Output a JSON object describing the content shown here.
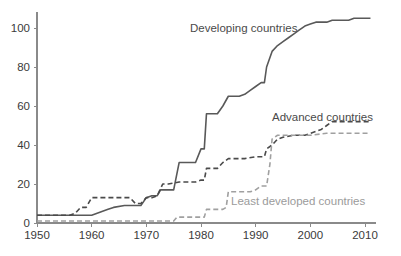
{
  "chart_data": {
    "type": "line",
    "title": "",
    "subtitle": "",
    "xlabel": "",
    "ylabel": "",
    "xlim": [
      1950,
      2012
    ],
    "ylim": [
      0,
      108
    ],
    "grid": false,
    "legend_position": "inline-annotations",
    "x_ticks": [
      1950,
      1960,
      1970,
      1980,
      1990,
      2000,
      2010
    ],
    "x_tick_labels": [
      "1950",
      "1960",
      "1970",
      "1980",
      "1990",
      "2000",
      "2010"
    ],
    "y_ticks": [
      0,
      20,
      40,
      60,
      80,
      100
    ],
    "y_tick_labels": [
      "0",
      "20",
      "40",
      "60",
      "80",
      "100"
    ],
    "series": [
      {
        "name": "Developing countries",
        "style": "solid",
        "color": "#595959",
        "width": 1.6,
        "label_x": 1978,
        "label_y": 101,
        "x": [
          1950,
          1956,
          1957,
          1959,
          1960,
          1961,
          1963,
          1964,
          1966,
          1967,
          1968,
          1969,
          1970,
          1971,
          1972,
          1972.6,
          1973,
          1975,
          1976,
          1977,
          1978,
          1979,
          1980,
          1980.6,
          1981,
          1983,
          1984,
          1985,
          1986,
          1987,
          1988,
          1989,
          1990,
          1991,
          1991.6,
          1992,
          1993,
          1994,
          1995,
          1996,
          1997,
          1998,
          1999,
          2000,
          2001,
          2003,
          2004,
          2007,
          2008,
          2011
        ],
        "y": [
          4,
          4,
          4,
          4,
          4,
          5,
          7,
          8,
          9,
          9,
          9,
          9,
          13,
          14,
          14,
          17,
          17,
          17,
          31,
          31,
          31,
          31,
          38,
          38,
          56,
          56,
          60,
          65,
          65,
          65,
          66,
          68,
          70,
          72,
          72,
          80,
          88,
          91,
          93,
          95,
          97,
          99,
          101,
          102,
          103,
          103,
          104,
          104,
          105,
          105
        ]
      },
      {
        "name": "Advanced countries",
        "style": "dashed",
        "color": "#4a4a4a",
        "width": 1.6,
        "label_x": 1997,
        "label_y": 57,
        "x": [
          1950,
          1956,
          1957,
          1958,
          1959,
          1960,
          1961,
          1964,
          1966,
          1967,
          1968,
          1969,
          1970,
          1971,
          1972,
          1973,
          1974,
          1976,
          1978,
          1979,
          1980,
          1980.6,
          1981,
          1983,
          1984,
          1985,
          1986,
          1988,
          1990,
          1991,
          1991.6,
          1992,
          1993,
          1994,
          1995,
          1997,
          1999,
          2000,
          2002,
          2003,
          2004,
          2006,
          2008,
          2011
        ],
        "y": [
          4,
          4,
          5,
          8,
          8,
          13,
          13,
          13,
          13,
          13,
          10,
          10,
          13,
          13,
          14,
          20,
          20,
          21,
          21,
          21,
          22,
          22,
          28,
          28,
          31,
          33,
          33,
          33,
          34,
          34,
          34,
          38,
          40,
          43,
          44,
          45,
          45,
          46,
          48,
          50,
          52,
          52,
          52,
          52
        ]
      },
      {
        "name": "Least developed countries",
        "style": "dashed",
        "color": "#a0a0a0",
        "width": 1.6,
        "label_x": 1985,
        "label_y": 14,
        "x": [
          1950,
          1960,
          1968,
          1970,
          1972,
          1974,
          1975,
          1975.6,
          1976,
          1978,
          1980,
          1980.6,
          1981,
          1983,
          1984,
          1984.6,
          1985,
          1987,
          1989,
          1990,
          1991,
          1992,
          1992.6,
          1993,
          1994,
          1995,
          1997,
          1999,
          2000,
          2003,
          2005,
          2007,
          2009,
          2011
        ],
        "y": [
          1,
          1,
          1,
          1,
          1,
          1,
          1,
          3,
          3,
          3,
          3,
          3,
          7,
          7,
          7,
          8,
          16,
          16,
          16,
          17,
          19,
          19,
          30,
          43,
          45,
          45,
          45,
          45,
          45,
          46,
          46,
          46,
          46,
          46
        ]
      }
    ],
    "annotations": [
      {
        "text": "Developing countries",
        "x_px": 190,
        "y_px": 32,
        "color": "#4a4a4a",
        "anchor": "start"
      },
      {
        "text": "Advanced countries",
        "x_px": 272,
        "y_px": 121,
        "color": "#4a4a4a",
        "anchor": "start"
      },
      {
        "text": "Least developed countries",
        "x_px": 231,
        "y_px": 205,
        "color": "#9b9b9b",
        "anchor": "start"
      }
    ]
  },
  "colors": {
    "background": "#ffffff",
    "axis": "#8a8a8a",
    "tick_text": "#3a3a3a",
    "developing": "#595959",
    "advanced": "#4a4a4a",
    "least_developed": "#a0a0a0"
  }
}
